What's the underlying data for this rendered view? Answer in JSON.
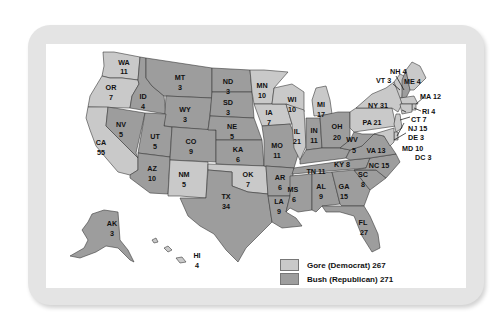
{
  "map": {
    "title": "2000 Presidential Election Electoral Votes",
    "colors": {
      "gore": "#c9c9c9",
      "bush": "#9d9d9d",
      "frame": "#e4e4e4",
      "border": "#3a3a3a"
    },
    "legend": [
      {
        "key": "gore",
        "label": "Gore (Democrat) 267",
        "color": "#c9c9c9"
      },
      {
        "key": "bush",
        "label": "Bush (Republican) 271",
        "color": "#9d9d9d"
      }
    ],
    "states": {
      "WA": {
        "abbr": "WA",
        "votes": "11",
        "winner": "gore"
      },
      "OR": {
        "abbr": "OR",
        "votes": "7",
        "winner": "gore"
      },
      "CA": {
        "abbr": "CA",
        "votes": "55",
        "winner": "gore"
      },
      "ID": {
        "abbr": "ID",
        "votes": "4",
        "winner": "bush"
      },
      "NV": {
        "abbr": "NV",
        "votes": "5",
        "winner": "bush"
      },
      "MT": {
        "abbr": "MT",
        "votes": "3",
        "winner": "bush"
      },
      "WY": {
        "abbr": "WY",
        "votes": "3",
        "winner": "bush"
      },
      "UT": {
        "abbr": "UT",
        "votes": "5",
        "winner": "bush"
      },
      "AZ": {
        "abbr": "AZ",
        "votes": "10",
        "winner": "bush"
      },
      "CO": {
        "abbr": "CO",
        "votes": "9",
        "winner": "bush"
      },
      "NM": {
        "abbr": "NM",
        "votes": "5",
        "winner": "gore"
      },
      "ND": {
        "abbr": "ND",
        "votes": "3",
        "winner": "bush"
      },
      "SD": {
        "abbr": "SD",
        "votes": "3",
        "winner": "bush"
      },
      "NE": {
        "abbr": "NE",
        "votes": "5",
        "winner": "bush"
      },
      "KA": {
        "abbr": "KA",
        "votes": "6",
        "winner": "bush"
      },
      "OK": {
        "abbr": "OK",
        "votes": "7",
        "winner": "gore"
      },
      "TX": {
        "abbr": "TX",
        "votes": "34",
        "winner": "bush"
      },
      "MN": {
        "abbr": "MN",
        "votes": "10",
        "winner": "gore"
      },
      "IA": {
        "abbr": "IA",
        "votes": "7",
        "winner": "gore"
      },
      "MO": {
        "abbr": "MO",
        "votes": "11",
        "winner": "bush"
      },
      "AR": {
        "abbr": "AR",
        "votes": "6",
        "winner": "bush"
      },
      "LA": {
        "abbr": "LA",
        "votes": "9",
        "winner": "bush"
      },
      "WI": {
        "abbr": "WI",
        "votes": "10",
        "winner": "gore"
      },
      "IL": {
        "abbr": "IL",
        "votes": "21",
        "winner": "gore"
      },
      "MI": {
        "abbr": "MI",
        "votes": "17",
        "winner": "gore"
      },
      "IN": {
        "abbr": "IN",
        "votes": "11",
        "winner": "bush"
      },
      "OH": {
        "abbr": "OH",
        "votes": "20",
        "winner": "bush"
      },
      "KY": {
        "abbr": "KY",
        "votes": "8",
        "winner": "bush"
      },
      "TN": {
        "abbr": "TN",
        "votes": "11",
        "winner": "bush"
      },
      "MS": {
        "abbr": "MS",
        "votes": "6",
        "winner": "bush"
      },
      "AL": {
        "abbr": "AL",
        "votes": "9",
        "winner": "bush"
      },
      "GA": {
        "abbr": "GA",
        "votes": "15",
        "winner": "bush"
      },
      "FL": {
        "abbr": "FL",
        "votes": "27",
        "winner": "bush"
      },
      "SC": {
        "abbr": "SC",
        "votes": "8",
        "winner": "bush"
      },
      "NC": {
        "abbr": "NC",
        "votes": "15",
        "winner": "bush"
      },
      "VA": {
        "abbr": "VA",
        "votes": "13",
        "winner": "bush"
      },
      "WV": {
        "abbr": "WV",
        "votes": "5",
        "winner": "bush"
      },
      "PA": {
        "abbr": "PA",
        "votes": "21",
        "winner": "gore"
      },
      "NY": {
        "abbr": "NY",
        "votes": "31",
        "winner": "gore"
      },
      "VT": {
        "abbr": "VT",
        "votes": "3",
        "winner": "gore"
      },
      "NH": {
        "abbr": "NH",
        "votes": "4",
        "winner": "bush"
      },
      "ME": {
        "abbr": "ME",
        "votes": "4",
        "winner": "gore"
      },
      "MA": {
        "abbr": "MA",
        "votes": "12",
        "winner": "gore"
      },
      "RI": {
        "abbr": "RI",
        "votes": "4",
        "winner": "gore"
      },
      "CT": {
        "abbr": "CT",
        "votes": "7",
        "winner": "gore"
      },
      "NJ": {
        "abbr": "NJ",
        "votes": "15",
        "winner": "gore"
      },
      "DE": {
        "abbr": "DE",
        "votes": "3",
        "winner": "gore"
      },
      "MD": {
        "abbr": "MD",
        "votes": "10",
        "winner": "gore"
      },
      "DC": {
        "abbr": "DC",
        "votes": "3",
        "winner": "gore"
      },
      "AK": {
        "abbr": "AK",
        "votes": "3",
        "winner": "bush"
      },
      "HI": {
        "abbr": "HI",
        "votes": "4",
        "winner": "gore"
      }
    },
    "external_labels": {
      "NH": "NH 4",
      "VT": "VT 3",
      "ME": "ME 4",
      "MA": "MA 12",
      "RI": "RI 4",
      "CT": "CT 7",
      "NJ": "NJ 15",
      "DE": "DE 3",
      "MD": "MD 10",
      "DC": "DC 3",
      "NY": "NY 31",
      "PA": "PA 21",
      "VA": "VA 13",
      "NC": "NC 15",
      "KY": "KY 8",
      "TN": "TN 11"
    }
  }
}
